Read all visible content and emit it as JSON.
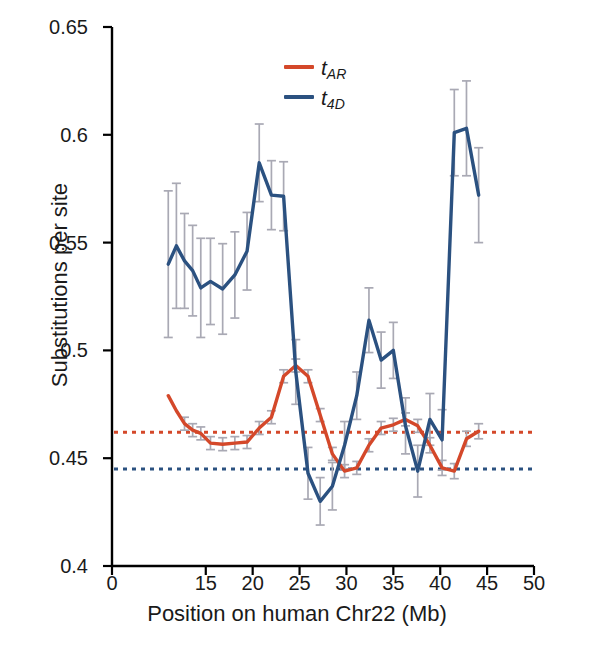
{
  "chart_data": {
    "type": "line",
    "title": "",
    "xlabel": "Position on human Chr22 (Mb)",
    "ylabel": "Substitutions per site",
    "xlim": [
      0,
      50
    ],
    "ylim": [
      0.4,
      0.65
    ],
    "xticks": [
      0,
      15,
      20,
      25,
      30,
      35,
      40,
      45,
      50
    ],
    "xtick_labels": [
      "0",
      "15",
      "20",
      "25",
      "30",
      "35",
      "40",
      "45",
      "50"
    ],
    "yticks": [
      0.4,
      0.45,
      0.5,
      0.55,
      0.6,
      0.65
    ],
    "ytick_labels": [
      "0.4",
      "0.45",
      "0.5",
      "0.55",
      "0.6",
      "0.65"
    ],
    "grid": false,
    "legend_position": "top-center",
    "errorbars": true,
    "errorbar_color": "#a9a9b4",
    "series": [
      {
        "name": "t_AR",
        "label": "t",
        "sublabel": "AR",
        "color": "#d4482a",
        "x": [
          9.0,
          10.3,
          11.6,
          12.9,
          14.2,
          15.5,
          16.8,
          18.1,
          19.4,
          20.7,
          22.0,
          23.3,
          24.6,
          25.9,
          27.2,
          28.5,
          29.8,
          31.1,
          32.4,
          33.7,
          35.0,
          36.3,
          37.6,
          38.9,
          40.2,
          41.5,
          42.8,
          44.1
        ],
        "values": [
          0.479,
          0.472,
          0.466,
          0.463,
          0.4615,
          0.457,
          0.4565,
          0.457,
          0.4575,
          0.464,
          0.469,
          0.488,
          0.493,
          0.488,
          0.47,
          0.452,
          0.444,
          0.4455,
          0.456,
          0.464,
          0.4655,
          0.468,
          0.465,
          0.456,
          0.4455,
          0.444,
          0.459,
          0.4625
        ],
        "errors": [
          0.0,
          0.0,
          0.003,
          0.003,
          0.003,
          0.003,
          0.003,
          0.003,
          0.003,
          0.003,
          0.003,
          0.003,
          0.003,
          0.003,
          0.003,
          0.003,
          0.003,
          0.003,
          0.003,
          0.003,
          0.003,
          0.003,
          0.003,
          0.0035,
          0.0035,
          0.0035,
          0.0035,
          0.0035
        ]
      },
      {
        "name": "t_4D",
        "label": "t",
        "sublabel": "4D",
        "color": "#2b5180",
        "x": [
          9.0,
          10.3,
          11.6,
          12.9,
          14.2,
          15.5,
          16.8,
          18.1,
          19.4,
          20.7,
          22.0,
          23.3,
          24.6,
          25.9,
          27.2,
          28.5,
          29.8,
          31.1,
          32.4,
          33.7,
          35.0,
          36.3,
          37.6,
          38.9,
          40.2,
          41.5,
          42.8,
          44.1
        ],
        "values": [
          0.54,
          0.5485,
          0.5415,
          0.537,
          0.529,
          0.532,
          0.5285,
          0.535,
          0.546,
          0.587,
          0.572,
          0.5715,
          0.49,
          0.443,
          0.43,
          0.437,
          0.456,
          0.479,
          0.514,
          0.4955,
          0.5,
          0.465,
          0.444,
          0.468,
          0.4585,
          0.601,
          0.603,
          0.572
        ],
        "errors": [
          0.034,
          0.029,
          0.022,
          0.021,
          0.023,
          0.02,
          0.021,
          0.02,
          0.018,
          0.018,
          0.016,
          0.016,
          0.015,
          0.012,
          0.011,
          0.011,
          0.011,
          0.011,
          0.015,
          0.013,
          0.013,
          0.013,
          0.012,
          0.012,
          0.014,
          0.02,
          0.022,
          0.022
        ]
      }
    ],
    "reference_lines": [
      {
        "name": "t_AR-mean",
        "value": 0.462,
        "color": "#d4482a",
        "style": "dotted"
      },
      {
        "name": "t_4D-mean",
        "value": 0.445,
        "color": "#2b5180",
        "style": "dotted"
      }
    ]
  },
  "legend": {
    "items": [
      {
        "name": "legend-t-ar",
        "label": "t",
        "sublabel": "AR",
        "color": "#d4482a"
      },
      {
        "name": "legend-t-4d",
        "label": "t",
        "sublabel": "4D",
        "color": "#2b5180"
      }
    ]
  }
}
